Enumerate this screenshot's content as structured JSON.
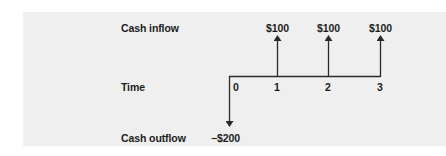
{
  "diagram": {
    "row_labels": {
      "inflow": "Cash inflow",
      "time": "Time",
      "outflow": "Cash outflow"
    },
    "periods": [
      "0",
      "1",
      "2",
      "3"
    ],
    "inflows": [
      {
        "period": "1",
        "label": "$100"
      },
      {
        "period": "2",
        "label": "$100"
      },
      {
        "period": "3",
        "label": "$100"
      }
    ],
    "outflows": [
      {
        "period": "0",
        "label": "−$200"
      }
    ],
    "colors": {
      "panel_background": "#efefef",
      "line": "#2a2a2a",
      "text": "#1c1c1c"
    }
  }
}
